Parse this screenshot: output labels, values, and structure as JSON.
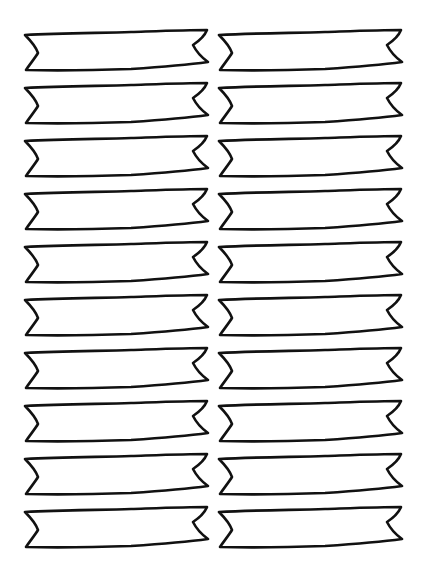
{
  "sheet": {
    "title": "",
    "columns": 2,
    "rows": 10,
    "stroke_color": "#111111",
    "background_color": "#ffffff"
  },
  "layout": {
    "col_x": [
      21,
      215
    ],
    "row_y": [
      27,
      80,
      133,
      186,
      239,
      292,
      345,
      398,
      451,
      504
    ]
  },
  "banners": [
    {
      "row": 1,
      "col": 1,
      "label": ""
    },
    {
      "row": 1,
      "col": 2,
      "label": ""
    },
    {
      "row": 2,
      "col": 1,
      "label": ""
    },
    {
      "row": 2,
      "col": 2,
      "label": ""
    },
    {
      "row": 3,
      "col": 1,
      "label": ""
    },
    {
      "row": 3,
      "col": 2,
      "label": ""
    },
    {
      "row": 4,
      "col": 1,
      "label": ""
    },
    {
      "row": 4,
      "col": 2,
      "label": ""
    },
    {
      "row": 5,
      "col": 1,
      "label": ""
    },
    {
      "row": 5,
      "col": 2,
      "label": ""
    },
    {
      "row": 6,
      "col": 1,
      "label": ""
    },
    {
      "row": 6,
      "col": 2,
      "label": ""
    },
    {
      "row": 7,
      "col": 1,
      "label": ""
    },
    {
      "row": 7,
      "col": 2,
      "label": ""
    },
    {
      "row": 8,
      "col": 1,
      "label": ""
    },
    {
      "row": 8,
      "col": 2,
      "label": ""
    },
    {
      "row": 9,
      "col": 1,
      "label": ""
    },
    {
      "row": 9,
      "col": 2,
      "label": ""
    },
    {
      "row": 10,
      "col": 1,
      "label": ""
    },
    {
      "row": 10,
      "col": 2,
      "label": ""
    }
  ]
}
